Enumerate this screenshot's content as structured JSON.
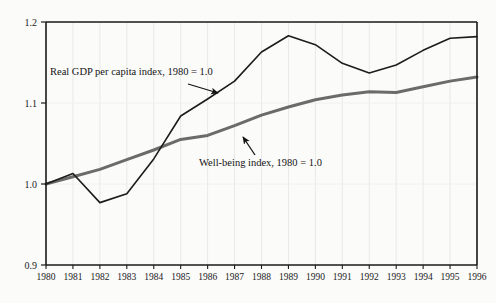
{
  "chart_data": {
    "type": "line",
    "title": "",
    "subtitle": "",
    "xlabel": "",
    "ylabel": "",
    "xlim": [
      1980,
      1996
    ],
    "ylim": [
      0.9,
      1.2
    ],
    "y_ticks": [
      "0.9",
      "1.0",
      "1.1",
      "1.2"
    ],
    "y_tick_values": [
      0.9,
      1.0,
      1.1,
      1.2
    ],
    "grid": true,
    "legend_position": "none",
    "categories": [
      1980,
      1981,
      1982,
      1983,
      1984,
      1985,
      1986,
      1987,
      1988,
      1989,
      1990,
      1991,
      1992,
      1993,
      1994,
      1995,
      1996
    ],
    "x_tick_labels": [
      "1980",
      "1981",
      "1982",
      "1983",
      "1984",
      "1985",
      "1986",
      "1987",
      "1988",
      "1989",
      "1990",
      "1991",
      "1992",
      "1993",
      "1994",
      "1995",
      "1996"
    ],
    "series": [
      {
        "name": "Real GDP per capita index, 1980 = 1.0",
        "color": "#1c1c1c",
        "width": 1.6,
        "values": [
          1.0,
          1.013,
          0.977,
          0.988,
          1.031,
          1.084,
          1.105,
          1.127,
          1.163,
          1.183,
          1.172,
          1.149,
          1.137,
          1.147,
          1.165,
          1.18,
          1.182
        ]
      },
      {
        "name": "Well-being index, 1980 = 1.0",
        "color": "#6b6b6b",
        "width": 3.0,
        "values": [
          1.0,
          1.009,
          1.018,
          1.03,
          1.042,
          1.055,
          1.06,
          1.072,
          1.085,
          1.095,
          1.104,
          1.11,
          1.114,
          1.113,
          1.12,
          1.127,
          1.132
        ]
      }
    ],
    "annotations": [
      {
        "id": "gdp-annotation",
        "text": "Real GDP per capita index, 1980 = 1.0",
        "text_x": 50,
        "text_y": 75,
        "arrow_from_x": 188,
        "arrow_from_y": 84,
        "arrow_to_x": 218,
        "arrow_to_y": 93
      },
      {
        "id": "wellbeing-annotation",
        "text": "Well-being index, 1980 = 1.0",
        "text_x": 199,
        "text_y": 166,
        "arrow_from_x": 255,
        "arrow_from_y": 155,
        "arrow_to_x": 243,
        "arrow_to_y": 137
      }
    ]
  }
}
